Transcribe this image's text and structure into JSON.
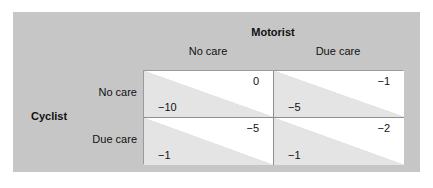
{
  "figure": {
    "type": "payoff-matrix",
    "panel_color": "#c6c6c6",
    "cell_shade_color": "#e4e4e4"
  },
  "columns": {
    "group_title": "Motorist",
    "headers": [
      "No care",
      "Due care"
    ]
  },
  "rows": {
    "group_title": "Cyclist",
    "headers": [
      "No care",
      "Due care"
    ]
  },
  "matrix": {
    "cells": [
      {
        "row": "No care",
        "column": "No care",
        "column_player_payoff": "0",
        "row_player_payoff": "−10"
      },
      {
        "row": "No care",
        "column": "Due care",
        "column_player_payoff": "−1",
        "row_player_payoff": "−5"
      },
      {
        "row": "Due care",
        "column": "No care",
        "column_player_payoff": "−5",
        "row_player_payoff": "−1"
      },
      {
        "row": "Due care",
        "column": "Due care",
        "column_player_payoff": "−2",
        "row_player_payoff": "−1"
      }
    ]
  },
  "chart_data": {
    "type": "table",
    "title": "",
    "row_player": "Cyclist",
    "column_player": "Motorist",
    "categories": [
      "No care",
      "Due care"
    ],
    "row_categories": [
      "No care",
      "Due care"
    ],
    "column_categories": [
      "No care",
      "Due care"
    ],
    "series": [
      {
        "name": "Cyclist payoff",
        "values": [
          [
            -10,
            -5
          ],
          [
            -1,
            -1
          ]
        ]
      },
      {
        "name": "Motorist payoff",
        "values": [
          [
            0,
            -1
          ],
          [
            -5,
            -2
          ]
        ]
      }
    ],
    "grid": true,
    "legend": "none"
  }
}
